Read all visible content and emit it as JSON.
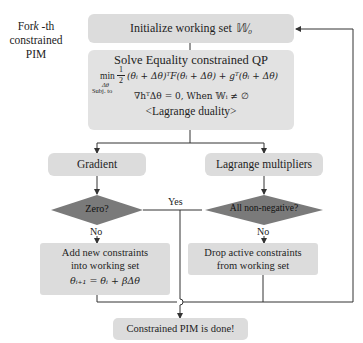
{
  "side_label": {
    "line1_prefix": "For",
    "line1_var": "k",
    "line1_suffix": " -th",
    "line2": "constrained",
    "line3": "PIM"
  },
  "nodes": {
    "init": {
      "label": "Initialize working set ",
      "symbol": "𝕎₀"
    },
    "qp": {
      "title": "Solve Equality constrained QP",
      "objective": "min½(θᵢ + Δθ)ᵀF(θᵢ + Δθ) + gᵀ(θᵢ + Δθ)",
      "objective_min": "min",
      "objective_sub": "Δθ",
      "objective_rest": "(θᵢ + Δθ)ᵀF(θᵢ + Δθ) + gᵀ(θᵢ + Δθ)",
      "frac_num": "1",
      "frac_den": "2",
      "subj_label": "Subj. to",
      "constraint": "∇hᵀΔθ = 0, When  𝕎ᵢ ≠ ∅",
      "duality": "<Lagrange duality>"
    },
    "gradient": {
      "label": "Gradient"
    },
    "lagrange": {
      "label": "Lagrange multipliers"
    },
    "zero_check": {
      "label": "Zero?"
    },
    "nonneg_check": {
      "label": "All non-negative?"
    },
    "add_constraints": {
      "line1": "Add new constraints",
      "line2": "into working set",
      "update": "θᵢ₊₁ = θᵢ + βΔθ"
    },
    "drop_constraints": {
      "line1": "Drop active constraints",
      "line2": "from working set"
    },
    "done": {
      "label": "Constrained PIM is done!"
    }
  },
  "edge_labels": {
    "yes": "Yes",
    "no_left": "No",
    "no_right": "No"
  },
  "colors": {
    "box_fill": "#dcdcdc",
    "diamond_fill": "#7a7a7a",
    "line": "#333333"
  }
}
